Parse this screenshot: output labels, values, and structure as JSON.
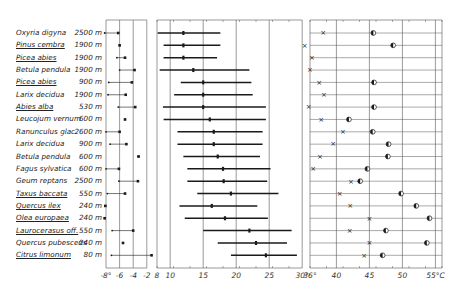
{
  "chart_data": [
    {
      "type": "scatter",
      "title": "",
      "panel": "left",
      "xlabel": "",
      "ylabel": "",
      "x_ticks": [
        "-8°",
        "-6",
        "-4",
        "-2"
      ],
      "xlim": [
        -8.5,
        -1.5
      ],
      "series": [
        {
          "name": "marker_low",
          "values": [
            -8.2,
            -6.0,
            -6.4,
            -6.0,
            -7.6,
            -7.7,
            -6.2,
            -5.2,
            -8.0,
            -7.4,
            -3.3,
            -8.0,
            -6.1,
            -7.8,
            -8.1,
            -8.2,
            -7.1,
            -5.5,
            -7.2
          ]
        },
        {
          "name": "marker_high",
          "values": [
            -6.2,
            -6.0,
            -5.2,
            -3.8,
            -4.2,
            -5.1,
            -3.7,
            -5.2,
            -6.0,
            -5.0,
            -3.2,
            -6.1,
            -3.3,
            -5.2,
            -8.1,
            -8.2,
            -4.0,
            -5.5,
            -1.3
          ]
        }
      ]
    },
    {
      "type": "bar",
      "title": "",
      "panel": "middle",
      "orientation": "horizontal-range",
      "x_ticks": [
        "8",
        "10",
        "15",
        "20",
        "25",
        "30°"
      ],
      "xlim": [
        7,
        31
      ],
      "series": [
        {
          "name": "range_start",
          "values": [
            8.1,
            9.0,
            9.0,
            8.4,
            11.6,
            10.6,
            8.9,
            9.0,
            11.1,
            11.1,
            12.0,
            12.6,
            12.6,
            14.1,
            11.4,
            12.2,
            15.0,
            17.2,
            19.2
          ]
        },
        {
          "name": "range_end",
          "values": [
            17.6,
            17.6,
            17.1,
            22.0,
            22.3,
            22.5,
            24.5,
            24.5,
            24.0,
            24.0,
            23.6,
            25.2,
            24.7,
            26.4,
            23.2,
            24.8,
            28.4,
            27.7,
            29.2
          ]
        },
        {
          "name": "mean",
          "values": [
            12.0,
            12.0,
            12.0,
            13.5,
            15.0,
            15.0,
            15.0,
            16.0,
            16.6,
            16.6,
            17.2,
            18.0,
            18.1,
            19.2,
            16.3,
            18.3,
            22.0,
            23.0,
            24.5
          ]
        }
      ]
    },
    {
      "type": "scatter",
      "title": "",
      "panel": "right",
      "x_ticks": [
        "36°",
        "40",
        "45",
        "50",
        "55°C"
      ],
      "xlim": [
        35.5,
        56
      ],
      "series": [
        {
          "name": "cross",
          "values": [
            38.0,
            35.2,
            36.3,
            36.0,
            37.4,
            38.1,
            35.8,
            37.7,
            41.0,
            39.5,
            37.5,
            36.5,
            42.2,
            40.5,
            42.1,
            45.0,
            42.0,
            45.0,
            44.2
          ]
        },
        {
          "name": "half_filled_circle",
          "values": [
            45.6,
            48.6,
            null,
            null,
            45.7,
            null,
            45.7,
            41.9,
            45.5,
            47.9,
            47.8,
            44.7,
            43.6,
            49.8,
            52.1,
            54.1,
            47.5,
            53.7,
            47.0
          ]
        }
      ]
    }
  ],
  "rows": [
    {
      "species": "Oxyria digyna",
      "altitude": "2500 m",
      "underline": false
    },
    {
      "species": "Pinus cembra",
      "altitude": "1900 m",
      "underline": true
    },
    {
      "species": "Picea abies",
      "altitude": "1900 m",
      "underline": true
    },
    {
      "species": "Betula pendula",
      "altitude": "1900 m",
      "underline": false
    },
    {
      "species": "Picea abies",
      "altitude": "900 m",
      "underline": true
    },
    {
      "species": "Larix decidua",
      "altitude": "1900 m",
      "underline": false
    },
    {
      "species": "Abies alba",
      "altitude": "530 m",
      "underline": true
    },
    {
      "species": "Leucojum vernum",
      "altitude": "600 m",
      "underline": false
    },
    {
      "species": "Ranunculus glac.",
      "altitude": "2600 m",
      "underline": false
    },
    {
      "species": "Larix decidua",
      "altitude": "900 m",
      "underline": false
    },
    {
      "species": "Betula pendula",
      "altitude": "600 m",
      "underline": false
    },
    {
      "species": "Fagus sylvatica",
      "altitude": "600 m",
      "underline": false
    },
    {
      "species": "Geum reptans",
      "altitude": "2500 m",
      "underline": false
    },
    {
      "species": "Taxus baccata",
      "altitude": "550 m",
      "underline": true
    },
    {
      "species": "Quercus ilex",
      "altitude": "240 m",
      "underline": true
    },
    {
      "species": "Olea europaea",
      "altitude": "240 m",
      "underline": true
    },
    {
      "species": "Laurocerasus off.",
      "altitude": "550 m",
      "underline": true
    },
    {
      "species": "Quercus pubescens",
      "altitude": "240 m",
      "underline": false
    },
    {
      "species": "Citrus limonum",
      "altitude": "80 m",
      "underline": true
    }
  ],
  "colors": {
    "ink": "#1a1a1a",
    "grid": "#555555",
    "background": "#ffffff"
  }
}
